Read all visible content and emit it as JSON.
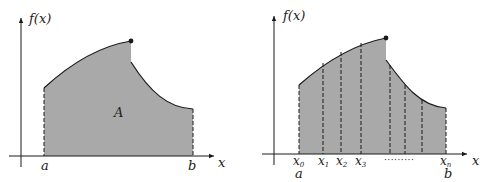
{
  "colors": {
    "fill": "#a9a9a9",
    "stroke": "#1a1a1a",
    "background": "#ffffff"
  },
  "left_panel": {
    "y_axis_label": "f(x)",
    "x_axis_label": "x",
    "area_label": "A",
    "lower_bound_label": "a",
    "upper_bound_label": "b"
  },
  "right_panel": {
    "y_axis_label": "f(x)",
    "x_axis_label": "x",
    "partition_labels": [
      {
        "base": "x",
        "sub": "0"
      },
      {
        "base": "x",
        "sub": "1"
      },
      {
        "base": "x",
        "sub": "2"
      },
      {
        "base": "x",
        "sub": "3"
      },
      {
        "base": "x",
        "sub": "n"
      }
    ],
    "ellipsis": "·········",
    "lower_bound_label": "a",
    "upper_bound_label": "b"
  }
}
